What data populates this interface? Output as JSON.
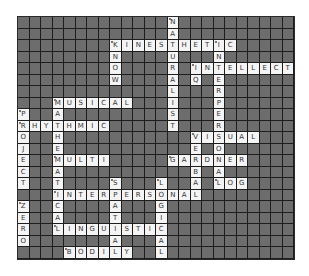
{
  "puzzle": {
    "rows": 21,
    "cols": 24,
    "colors": {
      "block": "#6d6d6d",
      "letter_cell": "#f4f4f4",
      "gridline": "#1e1e1e",
      "letter": "#333333"
    },
    "words": [
      {
        "answer": "NATURALIST",
        "row": 0,
        "col": 13,
        "dir": "down"
      },
      {
        "answer": "KINESTHETIC",
        "row": 2,
        "col": 8,
        "dir": "across"
      },
      {
        "answer": "KNOW",
        "row": 2,
        "col": 8,
        "dir": "down"
      },
      {
        "answer": "INTERPERSONAL",
        "row": 2,
        "col": 17,
        "dir": "down"
      },
      {
        "answer": "INTELLECT",
        "row": 4,
        "col": 15,
        "dir": "across"
      },
      {
        "answer": "IQ",
        "row": 4,
        "col": 15,
        "dir": "down"
      },
      {
        "answer": "MUSICAL",
        "row": 7,
        "col": 3,
        "dir": "across"
      },
      {
        "answer": "MATHEMATICAL",
        "row": 7,
        "col": 3,
        "dir": "down"
      },
      {
        "answer": "PROJECT",
        "row": 8,
        "col": 0,
        "dir": "down"
      },
      {
        "answer": "RHYTHMIC",
        "row": 9,
        "col": 0,
        "dir": "across"
      },
      {
        "answer": "VISUAL",
        "row": 10,
        "col": 15,
        "dir": "across"
      },
      {
        "answer": "VERBAL",
        "row": 10,
        "col": 15,
        "dir": "down"
      },
      {
        "answer": "MULTI",
        "row": 12,
        "col": 3,
        "dir": "across"
      },
      {
        "answer": "GARDNER",
        "row": 12,
        "col": 13,
        "dir": "across"
      },
      {
        "answer": "LOG",
        "row": 14,
        "col": 17,
        "dir": "across"
      },
      {
        "answer": "SPATIAL",
        "row": 14,
        "col": 8,
        "dir": "down"
      },
      {
        "answer": "LOGICAL",
        "row": 14,
        "col": 12,
        "dir": "down"
      },
      {
        "answer": "INTERPERSONAL",
        "row": 15,
        "col": 3,
        "dir": "across"
      },
      {
        "answer": "ZERO",
        "row": 16,
        "col": 0,
        "dir": "down"
      },
      {
        "answer": "LINGUISTIC",
        "row": 18,
        "col": 3,
        "dir": "across"
      },
      {
        "answer": "BODILY",
        "row": 20,
        "col": 4,
        "dir": "across"
      }
    ]
  }
}
